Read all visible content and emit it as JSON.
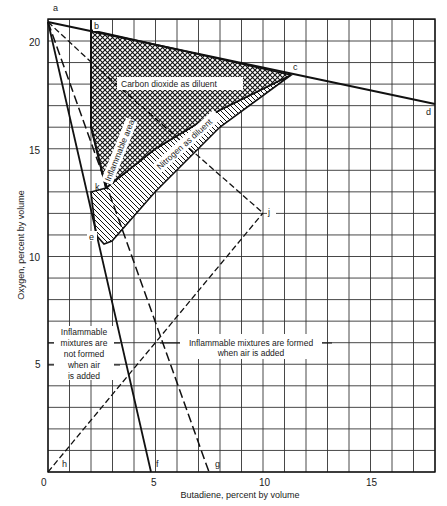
{
  "chart_data": {
    "type": "line",
    "title": "",
    "xlabel": "Butadiene, percent by volume",
    "ylabel": "Oxygen, percent by volume",
    "xlim": [
      0,
      18
    ],
    "ylim": [
      0,
      21
    ],
    "grid": true,
    "x_ticks": [
      0,
      5,
      10,
      15
    ],
    "y_ticks": [
      5,
      10,
      15,
      20
    ],
    "x_tick_labels": [
      "0",
      "5",
      "10",
      "15"
    ],
    "y_tick_labels": [
      "5",
      "10",
      "15",
      "20"
    ],
    "points": {
      "a": {
        "x": 0,
        "y": 20.9
      },
      "b": {
        "x": 2.0,
        "y": 20.5
      },
      "c": {
        "x": 11.3,
        "y": 18.4
      },
      "d": {
        "x": 18.0,
        "y": 17.1
      },
      "e": {
        "x": 2.6,
        "y": 10.6
      },
      "f": {
        "x": 4.8,
        "y": 0
      },
      "g": {
        "x": 7.5,
        "y": 0
      },
      "h": {
        "x": 0,
        "y": 0
      },
      "j": {
        "x": 10.0,
        "y": 12.0
      },
      "k": {
        "x": 2.3,
        "y": 13.2
      }
    },
    "series": [
      {
        "name": "Air line a-d",
        "style": "solid",
        "x": [
          0,
          18
        ],
        "y": [
          20.9,
          17.1
        ]
      },
      {
        "name": "Line a-f",
        "style": "solid",
        "x": [
          0,
          4.8
        ],
        "y": [
          20.9,
          0
        ]
      },
      {
        "name": "Line a-g",
        "style": "long-dash",
        "x": [
          0,
          7.5
        ],
        "y": [
          20.9,
          0
        ]
      },
      {
        "name": "Line a-j",
        "style": "dash",
        "x": [
          0,
          2.0,
          10.0
        ],
        "y": [
          20.9,
          19.0,
          12.0
        ]
      },
      {
        "name": "Line h-j",
        "style": "dash",
        "x": [
          0,
          10.0
        ],
        "y": [
          0,
          12.0
        ]
      },
      {
        "name": "Boundary b-k (CO2)",
        "style": "solid",
        "x": [
          2.0,
          2.0,
          2.7
        ],
        "y": [
          20.5,
          16.0,
          13.2
        ]
      },
      {
        "name": "CO2 lower boundary",
        "style": "solid",
        "x": [
          2.7,
          5.0,
          8.0,
          11.3
        ],
        "y": [
          13.2,
          15.0,
          16.8,
          18.4
        ]
      },
      {
        "name": "N2 lower boundary",
        "style": "solid",
        "x": [
          2.6,
          3.0,
          5.0,
          8.0,
          11.3
        ],
        "y": [
          10.6,
          10.7,
          13.0,
          16.0,
          18.4
        ]
      }
    ],
    "regions": [
      {
        "name": "Carbon dioxide as diluent",
        "pattern": "crosshatch",
        "polygon": [
          [
            2.0,
            20.5
          ],
          [
            11.3,
            18.4
          ],
          [
            8.0,
            16.8
          ],
          [
            5.0,
            15.0
          ],
          [
            2.7,
            13.2
          ],
          [
            2.0,
            16.0
          ]
        ]
      },
      {
        "name": "Nitrogen as diluent",
        "pattern": "diagonal-hatch",
        "polygon": [
          [
            2.0,
            13.0
          ],
          [
            2.7,
            13.2
          ],
          [
            5.0,
            15.0
          ],
          [
            8.0,
            16.8
          ],
          [
            11.3,
            18.4
          ],
          [
            8.0,
            16.0
          ],
          [
            5.0,
            13.0
          ],
          [
            3.0,
            10.7
          ],
          [
            2.6,
            10.6
          ],
          [
            2.2,
            11.0
          ]
        ]
      }
    ],
    "annotations": [
      {
        "text": "Carbon dioxide as diluent",
        "x": 7.0,
        "y": 17.8
      },
      {
        "text": "Nitrogen as diluent",
        "x": 6.4,
        "y": 15.0,
        "rotation": -40
      },
      {
        "text": "Inflammable area",
        "x": 3.9,
        "y": 14.0,
        "rotation": -65
      },
      {
        "text": "Inflammable mixtures are not formed when air is added",
        "x": 2.2,
        "y": 5.8
      },
      {
        "text": "Inflammable mixtures are formed when air is added",
        "x": 8.6,
        "y": 5.8
      }
    ]
  },
  "labels": {
    "a": "a",
    "b": "b",
    "c": "c",
    "d": "d",
    "e": "e",
    "f": "f",
    "g": "g",
    "h": "h",
    "j": "j",
    "k": "k",
    "co2": "Carbon dioxide as diluent",
    "n2": "Nitrogen as diluent",
    "area": "Inflammable area",
    "not_formed": [
      "Inflammable",
      "mixtures are",
      "not formed",
      "when air",
      "is added"
    ],
    "formed": [
      "Inflammable mixtures are formed",
      "when air is added"
    ]
  },
  "axes": {
    "x_title": "Butadiene, percent by volume",
    "y_title": "Oxygen, percent by volume",
    "x0": "0",
    "x5": "5",
    "x10": "10",
    "x15": "15",
    "y5": "5",
    "y10": "10",
    "y15": "15",
    "y20": "20"
  }
}
